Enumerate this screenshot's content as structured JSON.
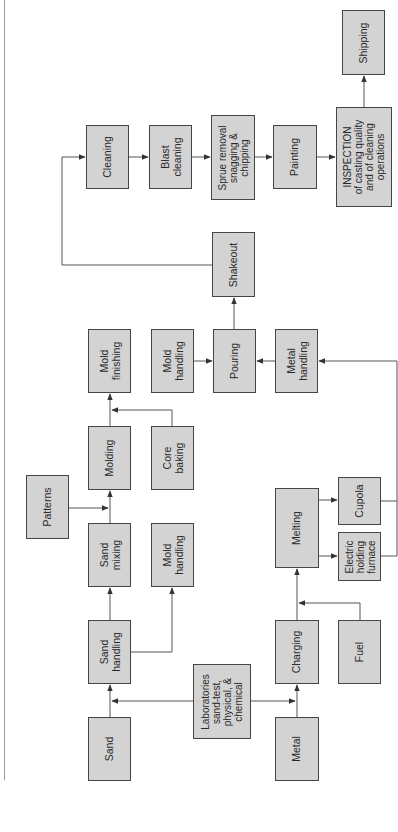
{
  "diagram": {
    "title": "",
    "colors": {
      "box_fill": "#d3d3d3",
      "box_border": "#454545",
      "line": "#555555"
    },
    "nodes": [
      {
        "id": "sand",
        "label": "Sand",
        "x": 88,
        "y": 717,
        "w": 43,
        "h": 64
      },
      {
        "id": "sand_handling",
        "label": "Sand\nhandling",
        "x": 88,
        "y": 620,
        "w": 43,
        "h": 64
      },
      {
        "id": "sand_mixing",
        "label": "Sand\nmixing",
        "x": 88,
        "y": 523,
        "w": 43,
        "h": 64
      },
      {
        "id": "molding",
        "label": "Molding",
        "x": 88,
        "y": 426,
        "w": 43,
        "h": 64
      },
      {
        "id": "mold_finishing",
        "label": "Mold\nfinishing",
        "x": 88,
        "y": 329,
        "w": 43,
        "h": 64
      },
      {
        "id": "patterns",
        "label": "Patterns",
        "x": 26,
        "y": 475,
        "w": 43,
        "h": 64
      },
      {
        "id": "mold_handling_1",
        "label": "Mold\nhandling",
        "x": 151,
        "y": 523,
        "w": 43,
        "h": 64
      },
      {
        "id": "core_baking",
        "label": "Core\nbaking",
        "x": 151,
        "y": 426,
        "w": 43,
        "h": 64
      },
      {
        "id": "mold_handling_2",
        "label": "Mold\nhandling",
        "x": 151,
        "y": 329,
        "w": 43,
        "h": 64
      },
      {
        "id": "laboratories",
        "label": "Laboratories\nsand-test,\nphysical, &\nchemical",
        "x": 193,
        "y": 664,
        "w": 58,
        "h": 75
      },
      {
        "id": "pouring",
        "label": "Pouring",
        "x": 213,
        "y": 329,
        "w": 43,
        "h": 64
      },
      {
        "id": "shakeout",
        "label": "Shakeout",
        "x": 212,
        "y": 232,
        "w": 43,
        "h": 65
      },
      {
        "id": "metal",
        "label": "Metal",
        "x": 275,
        "y": 717,
        "w": 44,
        "h": 64
      },
      {
        "id": "charging",
        "label": "Charging",
        "x": 275,
        "y": 620,
        "w": 44,
        "h": 64
      },
      {
        "id": "melting",
        "label": "Melting",
        "x": 275,
        "y": 488,
        "w": 44,
        "h": 80
      },
      {
        "id": "metal_handling",
        "label": "Metal\nhandling",
        "x": 275,
        "y": 329,
        "w": 43,
        "h": 64
      },
      {
        "id": "fuel",
        "label": "Fuel",
        "x": 338,
        "y": 620,
        "w": 43,
        "h": 64
      },
      {
        "id": "cupola",
        "label": "Cupola",
        "x": 338,
        "y": 477,
        "w": 43,
        "h": 48
      },
      {
        "id": "electric_furnace",
        "label": "Electric\nholding\nfurnace",
        "x": 338,
        "y": 532,
        "w": 43,
        "h": 49
      },
      {
        "id": "cleaning",
        "label": "Cleaning",
        "x": 86,
        "y": 125,
        "w": 43,
        "h": 64
      },
      {
        "id": "blast_cleaning",
        "label": "Blast\ncleaning",
        "x": 149,
        "y": 125,
        "w": 43,
        "h": 64
      },
      {
        "id": "sprue_removal",
        "label": "Sprue removal\nsnagging &\nchipping",
        "x": 211,
        "y": 115,
        "w": 44,
        "h": 85
      },
      {
        "id": "painting",
        "label": "Painting",
        "x": 273,
        "y": 125,
        "w": 44,
        "h": 64
      },
      {
        "id": "inspection",
        "label": "INSPECTION\nof casting quality\nand of cleaning\noperations",
        "x": 336,
        "y": 107,
        "w": 56,
        "h": 100
      },
      {
        "id": "shipping",
        "label": "Shipping",
        "x": 342,
        "y": 10,
        "w": 43,
        "h": 65
      }
    ],
    "edges": [
      {
        "from": "sand",
        "to": "sand_handling"
      },
      {
        "from": "laboratories",
        "to": "sand_handling"
      },
      {
        "from": "laboratories",
        "to": "charging"
      },
      {
        "from": "sand_handling",
        "to": "sand_mixing"
      },
      {
        "from": "sand_handling",
        "to": "mold_handling_1"
      },
      {
        "from": "sand_mixing",
        "to": "molding"
      },
      {
        "from": "patterns",
        "to": "molding"
      },
      {
        "from": "molding",
        "to": "mold_finishing"
      },
      {
        "from": "core_baking",
        "to": "mold_finishing"
      },
      {
        "from": "mold_handling_2",
        "to": "pouring"
      },
      {
        "from": "metal_handling",
        "to": "pouring"
      },
      {
        "from": "pouring",
        "to": "shakeout"
      },
      {
        "from": "shakeout",
        "to": "cleaning"
      },
      {
        "from": "metal",
        "to": "charging"
      },
      {
        "from": "fuel",
        "to": "melting"
      },
      {
        "from": "charging",
        "to": "melting"
      },
      {
        "from": "melting",
        "to": "cupola"
      },
      {
        "from": "melting",
        "to": "electric_furnace"
      },
      {
        "from": "cupola",
        "to": "metal_handling"
      },
      {
        "from": "electric_furnace",
        "to": "metal_handling"
      },
      {
        "from": "cleaning",
        "to": "blast_cleaning"
      },
      {
        "from": "blast_cleaning",
        "to": "sprue_removal"
      },
      {
        "from": "sprue_removal",
        "to": "painting"
      },
      {
        "from": "painting",
        "to": "inspection"
      },
      {
        "from": "inspection",
        "to": "shipping"
      }
    ]
  }
}
